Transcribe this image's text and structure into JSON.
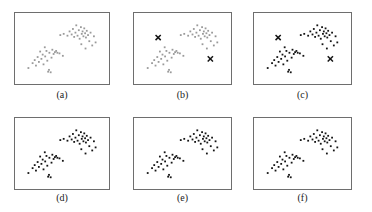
{
  "figure": {
    "background_color": "#ffffff",
    "frame_color": "#6e6e6e",
    "caption_color": "#1a1a1a",
    "point_color_light": "#9a9a9a",
    "point_color_dark": "#141414",
    "marker_color": "#141414",
    "rows": 2,
    "columns": 3
  },
  "chart_data": {
    "type": "scatter",
    "xlabel": "",
    "ylabel": "",
    "xlim": [
      0,
      100
    ],
    "ylim": [
      0,
      100
    ],
    "grid": false,
    "legend": "none",
    "axis_ticks": "none",
    "shared_points": {
      "cluster_lower_left": [
        [
          10.0,
          18.0
        ],
        [
          15.0,
          26.0
        ],
        [
          17.5,
          31.0
        ],
        [
          19.0,
          22.0
        ],
        [
          21.0,
          36.0
        ],
        [
          22.5,
          28.0
        ],
        [
          24.0,
          45.0
        ],
        [
          25.5,
          33.0
        ],
        [
          27.0,
          40.0
        ],
        [
          28.0,
          24.0
        ],
        [
          29.5,
          52.0
        ],
        [
          30.0,
          37.0
        ],
        [
          31.5,
          46.0
        ],
        [
          32.5,
          30.0
        ],
        [
          33.5,
          12.0
        ],
        [
          34.5,
          15.0
        ],
        [
          35.0,
          43.0
        ],
        [
          36.5,
          11.0
        ],
        [
          37.5,
          35.0
        ],
        [
          38.5,
          48.0
        ],
        [
          40.0,
          41.0
        ],
        [
          41.5,
          44.0
        ],
        [
          43.0,
          46.0
        ],
        [
          44.5,
          43.0
        ],
        [
          47.0,
          42.0
        ],
        [
          51.0,
          38.0
        ]
      ],
      "cluster_upper_right": [
        [
          48.0,
          72.0
        ],
        [
          52.0,
          74.0
        ],
        [
          56.5,
          71.0
        ],
        [
          59.0,
          78.0
        ],
        [
          61.5,
          73.0
        ],
        [
          63.0,
          82.0
        ],
        [
          64.5,
          69.0
        ],
        [
          66.0,
          76.0
        ],
        [
          67.0,
          88.0
        ],
        [
          68.5,
          71.0
        ],
        [
          70.0,
          80.0
        ],
        [
          71.0,
          66.0
        ],
        [
          72.5,
          85.0
        ],
        [
          73.5,
          74.0
        ],
        [
          74.5,
          78.0
        ],
        [
          75.5,
          70.0
        ],
        [
          76.5,
          83.0
        ],
        [
          77.5,
          75.0
        ],
        [
          78.5,
          68.0
        ],
        [
          79.5,
          79.0
        ],
        [
          81.0,
          72.0
        ],
        [
          82.5,
          62.0
        ],
        [
          84.0,
          76.0
        ],
        [
          86.0,
          55.0
        ],
        [
          88.0,
          70.0
        ],
        [
          90.0,
          60.0
        ],
        [
          73.0,
          57.0
        ],
        [
          78.0,
          50.0
        ]
      ]
    },
    "series": [
      {
        "name": "data points",
        "marker": "dot",
        "point_count": 54
      },
      {
        "name": "centroids",
        "marker": "x",
        "point_count": 2
      }
    ]
  },
  "panels": [
    {
      "id": "panel-a",
      "caption": "(a)",
      "point_style": "light",
      "centroids_visible": false,
      "centroids": []
    },
    {
      "id": "panel-b",
      "caption": "(b)",
      "point_style": "light",
      "centroids_visible": true,
      "centroids": [
        [
          22.0,
          68.0
        ],
        [
          82.0,
          33.0
        ]
      ]
    },
    {
      "id": "panel-c",
      "caption": "(c)",
      "point_style": "dark",
      "centroids_visible": true,
      "centroids": [
        [
          22.0,
          68.0
        ],
        [
          82.0,
          33.0
        ]
      ]
    },
    {
      "id": "panel-d",
      "caption": "(d)",
      "point_style": "dark",
      "centroids_visible": false,
      "centroids": []
    },
    {
      "id": "panel-e",
      "caption": "(e)",
      "point_style": "dark",
      "centroids_visible": false,
      "centroids": []
    },
    {
      "id": "panel-f",
      "caption": "(f)",
      "point_style": "dark",
      "centroids_visible": false,
      "centroids": []
    }
  ],
  "layout": {
    "panel_boxes": [
      {
        "left": 14,
        "top": 12,
        "width": 96,
        "height": 73
      },
      {
        "left": 133,
        "top": 12,
        "width": 99,
        "height": 73
      },
      {
        "left": 253,
        "top": 12,
        "width": 99,
        "height": 73
      },
      {
        "left": 14,
        "top": 117,
        "width": 96,
        "height": 73
      },
      {
        "left": 133,
        "top": 117,
        "width": 99,
        "height": 73
      },
      {
        "left": 253,
        "top": 117,
        "width": 99,
        "height": 73
      }
    ],
    "caption_tops": [
      89,
      89,
      89,
      192,
      192,
      192
    ]
  }
}
